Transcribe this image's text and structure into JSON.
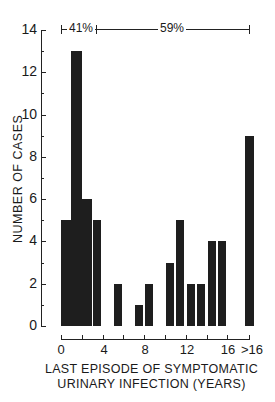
{
  "chart_data": {
    "type": "bar",
    "title": "",
    "xlabel": "LAST EPISODE OF SYMPTOMATIC URINARY INFECTION (YEARS)",
    "xlabel_lines": [
      "LAST EPISODE OF SYMPTOMATIC",
      "URINARY INFECTION (YEARS)"
    ],
    "ylabel": "NUMBER OF CASES",
    "ylim": [
      0,
      14
    ],
    "yticks": [
      0,
      2,
      4,
      6,
      8,
      10,
      12,
      14
    ],
    "xtick_labels": [
      "0",
      "4",
      "8",
      "12",
      "16",
      ">16"
    ],
    "categories": [
      "0-1",
      "1-2",
      "2-3",
      "3-4",
      "4-5",
      "5-6",
      "6-7",
      "7-8",
      "8-9",
      "9-10",
      "10-11",
      "11-12",
      "12-13",
      "13-14",
      "14-15",
      "15-16",
      ">16"
    ],
    "values": [
      5,
      13,
      6,
      5,
      0,
      2,
      0,
      1,
      2,
      0,
      3,
      5,
      2,
      2,
      4,
      4,
      9
    ],
    "annotations": [
      {
        "label": "41%",
        "span": "0-3 years"
      },
      {
        "label": "59%",
        "span": "3 years to >16"
      }
    ],
    "grid": false,
    "legend": null
  }
}
